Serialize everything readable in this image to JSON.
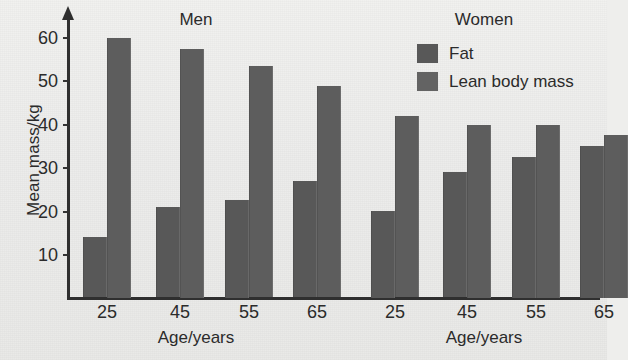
{
  "chart_data": {
    "type": "bar",
    "title": "",
    "xlabel": "Age/years",
    "ylabel": "Mean mass/kg",
    "ylim": [
      0,
      65
    ],
    "yticks": [
      10,
      20,
      30,
      40,
      50,
      60
    ],
    "grid": false,
    "legend_position": "top-right",
    "categories": [
      "25",
      "45",
      "55",
      "65"
    ],
    "panels": [
      {
        "label": "Men",
        "xlabel": "Age/years",
        "categories": [
          "25",
          "45",
          "55",
          "65"
        ],
        "series": [
          {
            "name": "Fat",
            "values": [
              14,
              21,
              22.5,
              27
            ]
          },
          {
            "name": "Lean body mass",
            "values": [
              60,
              57.5,
              53.5,
              49
            ]
          }
        ]
      },
      {
        "label": "Women",
        "xlabel": "Age/years",
        "categories": [
          "25",
          "45",
          "55",
          "65"
        ],
        "series": [
          {
            "name": "Fat",
            "values": [
              20,
              29,
              32.5,
              35
            ]
          },
          {
            "name": "Lean body mass",
            "values": [
              42,
              40,
              40,
              37.5
            ]
          }
        ]
      }
    ],
    "legend": [
      {
        "label": "Fat",
        "color": "#585858"
      },
      {
        "label": "Lean body mass",
        "color": "#636363"
      }
    ]
  },
  "axis": {
    "y_label": "Mean mass/kg",
    "y_ticks": [
      "60",
      "50",
      "40",
      "30",
      "20",
      "10"
    ],
    "x_ticks_men": [
      "25",
      "45",
      "55",
      "65"
    ],
    "x_ticks_women": [
      "25",
      "45",
      "55",
      "65"
    ],
    "x_label_men": "Age/years",
    "x_label_women": "Age/years"
  },
  "panel_titles": {
    "men": "Men",
    "women": "Women"
  },
  "legend": {
    "fat": "Fat",
    "lean": "Lean body mass"
  },
  "colors": {
    "fat": "#585858",
    "lean": "#5d5d5d",
    "axis": "#2f2f2f",
    "background": "#eeeeec"
  }
}
